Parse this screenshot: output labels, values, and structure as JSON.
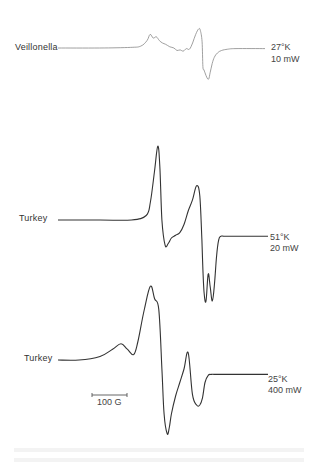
{
  "chart_data": {
    "type": "line",
    "title": "",
    "xlabel": "Magnetic field",
    "ylabel": "EPR signal (derivative, arbitrary units)",
    "grid": false,
    "scale_bar": {
      "label": "100 G",
      "value_gauss": 100
    },
    "x_units": "relative field, 0-100 (100 G scale bar spans about 15 units)",
    "y_units": "relative derivative amplitude",
    "series": [
      {
        "name": "Veillonella",
        "label": "Veillonella",
        "conditions": [
          "27°K",
          "10 mW"
        ],
        "x": [
          0,
          20,
          35,
          40,
          43,
          44.5,
          46,
          47.5,
          49,
          50.5,
          52,
          54,
          56,
          57.5,
          59,
          60.5,
          62,
          63.5,
          65,
          66.5,
          68,
          68.8,
          69.6,
          70,
          70.5,
          71,
          72,
          72.8,
          73.5,
          74.5,
          75.5,
          77,
          79,
          82,
          86,
          100
        ],
        "y": [
          0,
          0,
          1,
          3,
          12,
          22,
          16,
          18,
          12,
          8,
          6,
          2,
          0,
          -4,
          -3,
          -5,
          -1,
          -2,
          8,
          22,
          31,
          28,
          10,
          -30,
          -35,
          -40,
          -48,
          -50,
          -40,
          -25,
          -15,
          -8,
          -4,
          -2,
          -1,
          -1
        ]
      },
      {
        "name": "Turkey (51°K, 20 mW)",
        "label": "Turkey",
        "conditions": [
          "51°K",
          "20 mW"
        ],
        "x": [
          0,
          20,
          35,
          42,
          44,
          46,
          47.5,
          48.5,
          49.5,
          51,
          52.5,
          54,
          56,
          58,
          60,
          62,
          64,
          66,
          67.5,
          68.5,
          69,
          69.6,
          70.5,
          71.5,
          72.5,
          73.5,
          74.5,
          75.5,
          76.5,
          77.5,
          79,
          82,
          86,
          100
        ],
        "y": [
          0,
          0,
          0,
          5,
          20,
          55,
          82,
          60,
          0,
          -28,
          -26,
          -20,
          -17,
          -14,
          -5,
          10,
          22,
          38,
          27,
          -22,
          -55,
          -82,
          -90,
          -60,
          -75,
          -90,
          -72,
          -40,
          -22,
          -18,
          -18,
          -18,
          -18,
          -18
        ]
      },
      {
        "name": "Turkey (25°K, 400 mW)",
        "label": "Turkey",
        "conditions": [
          "25°K",
          "400 mW"
        ],
        "x": [
          0,
          10,
          20,
          26,
          30,
          33,
          36,
          38,
          41,
          44,
          46,
          48,
          49.5,
          50.5,
          52,
          53,
          54,
          56,
          58,
          60,
          62,
          64,
          66,
          67.5,
          68.8,
          70,
          71.5,
          73,
          75,
          77,
          79,
          81,
          84,
          88,
          100
        ],
        "y": [
          0,
          0,
          4,
          12,
          18,
          12,
          6,
          20,
          55,
          82,
          68,
          56,
          -10,
          -60,
          -82,
          -75,
          -60,
          -40,
          -25,
          -10,
          8,
          -38,
          -50,
          -50,
          -42,
          -25,
          -17,
          -16,
          -16,
          -16,
          -16,
          -16,
          -16,
          -16,
          -16
        ]
      }
    ]
  },
  "labels": {
    "trace1_name": "Veillonella",
    "trace1_temp": "27°K",
    "trace1_power": "10 mW",
    "trace2_name": "Turkey",
    "trace2_temp": "51°K",
    "trace2_power": "20 mW",
    "trace3_name": "Turkey",
    "trace3_temp": "25°K",
    "trace3_power": "400 mW",
    "scale_bar": "100 G"
  }
}
